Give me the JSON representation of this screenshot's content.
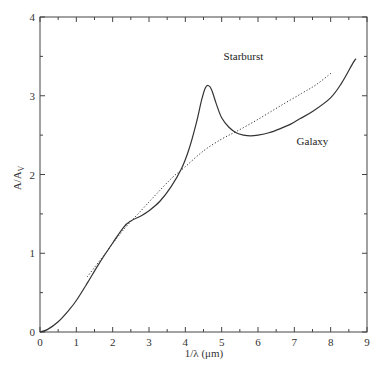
{
  "chart_data": {
    "type": "line",
    "title": "",
    "xlabel": "1/λ (μm)",
    "ylabel": "A/A_V",
    "ylabel_main": "A/A",
    "ylabel_sub": "V",
    "xlim": [
      0,
      9
    ],
    "ylim": [
      0,
      4
    ],
    "x_ticks": [
      "0",
      "1",
      "2",
      "3",
      "4",
      "5",
      "6",
      "7",
      "8",
      "9"
    ],
    "y_ticks": [
      "0",
      "1",
      "2",
      "3",
      "4"
    ],
    "grid": false,
    "legend": "none (curves labeled directly)",
    "annotations": [
      {
        "text": "Starburst",
        "x": 5.6,
        "y": 3.45
      },
      {
        "text": "Galaxy",
        "x": 7.5,
        "y": 2.37
      }
    ],
    "series": [
      {
        "name": "Galaxy",
        "style": "solid",
        "x": [
          0.0,
          0.2,
          0.5,
          0.8,
          1.0,
          1.3,
          1.6,
          2.0,
          2.3,
          2.5,
          2.8,
          3.0,
          3.3,
          3.6,
          3.9,
          4.1,
          4.3,
          4.45,
          4.55,
          4.63,
          4.72,
          4.85,
          5.0,
          5.2,
          5.4,
          5.6,
          5.8,
          6.0,
          6.3,
          6.6,
          6.9,
          7.16,
          7.5,
          7.99,
          8.3,
          8.62,
          8.7
        ],
        "y": [
          0.0,
          0.03,
          0.13,
          0.28,
          0.4,
          0.62,
          0.85,
          1.13,
          1.33,
          1.41,
          1.48,
          1.54,
          1.66,
          1.84,
          2.08,
          2.32,
          2.65,
          2.95,
          3.1,
          3.13,
          3.08,
          2.9,
          2.72,
          2.6,
          2.53,
          2.5,
          2.49,
          2.5,
          2.53,
          2.58,
          2.64,
          2.71,
          2.8,
          2.97,
          3.16,
          3.42,
          3.47
        ]
      },
      {
        "name": "Starburst",
        "style": "dotted",
        "x": [
          1.3,
          1.8,
          2.3,
          2.8,
          3.2,
          3.64,
          4.0,
          4.5,
          5.0,
          5.42,
          6.0,
          6.61,
          7.2,
          7.6,
          8.02
        ],
        "y": [
          0.7,
          1.0,
          1.3,
          1.55,
          1.75,
          1.96,
          2.1,
          2.3,
          2.45,
          2.55,
          2.7,
          2.87,
          3.03,
          3.14,
          3.29
        ]
      }
    ]
  }
}
